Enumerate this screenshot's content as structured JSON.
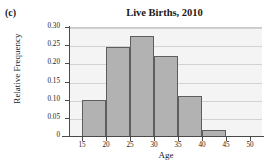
{
  "figure": {
    "panel_label": "(c)"
  },
  "chart_data": {
    "type": "bar",
    "title": "Live Births, 2010",
    "xlabel": "Age",
    "ylabel": "Relative Frequency",
    "xlim": [
      12.5,
      52.5
    ],
    "ylim": [
      0,
      0.3
    ],
    "grid": true,
    "legend": null,
    "bin_width": 5,
    "bin_edges": [
      15,
      20,
      25,
      30,
      35,
      40,
      45
    ],
    "categories": [
      "15-20",
      "20-25",
      "25-30",
      "30-35",
      "35-40",
      "40-45"
    ],
    "values": [
      0.103,
      0.248,
      0.278,
      0.222,
      0.113,
      0.02
    ],
    "xticks": [
      15,
      20,
      25,
      30,
      35,
      40,
      45,
      50
    ],
    "xtick_labels": [
      "15",
      "20",
      "25",
      "30",
      "35",
      "40",
      "45",
      "50"
    ],
    "yticks": [
      0,
      0.05,
      0.1,
      0.15,
      0.2,
      0.25,
      0.3
    ],
    "ytick_labels": [
      "0",
      "0.05",
      "0.10",
      "0.15",
      "0.20",
      "0.25",
      "0.30"
    ],
    "bar_fill_color": "#b2b2b2",
    "bar_edge_color": "#5e5e5e",
    "plot_background_color": "#f4f4f4",
    "gridline_color": "#d2d2d2",
    "axis_color": "#4a4a4a"
  }
}
